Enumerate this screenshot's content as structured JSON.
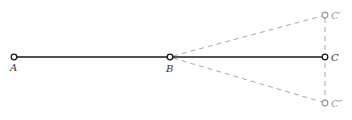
{
  "diagram": {
    "colors": {
      "solid": "#1a1a1a",
      "dashed": "#a0a0a0",
      "label_dark": "#333333",
      "label_gray": "#999999"
    },
    "points": {
      "A": {
        "label": "A",
        "x": 14,
        "y": 57
      },
      "B": {
        "label": "B",
        "x": 170,
        "y": 57
      },
      "C": {
        "label": "C",
        "x": 325,
        "y": 57
      },
      "C_prime": {
        "label": "C′",
        "x": 325,
        "y": 15
      },
      "C_double_prime": {
        "label": "C″",
        "x": 325,
        "y": 103
      }
    },
    "segments": [
      {
        "from": "A",
        "to": "C",
        "style": "solid"
      },
      {
        "from": "B",
        "to": "C′",
        "style": "dashed"
      },
      {
        "from": "B",
        "to": "C″",
        "style": "dashed"
      },
      {
        "from": "C′",
        "to": "C″",
        "style": "dashed"
      }
    ]
  }
}
